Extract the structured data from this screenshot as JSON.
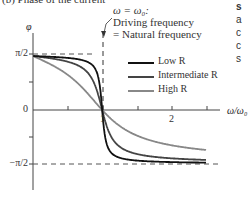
{
  "chart_data": {
    "type": "line",
    "title": "(b) Phase of the current",
    "xlabel": "ω/ω0",
    "ylabel": "φ",
    "xlim": [
      0,
      2.5
    ],
    "ylim": [
      -1.5708,
      1.5708
    ],
    "x_ticks": [
      0.5,
      1,
      1.5,
      2,
      2.5
    ],
    "x_tick_labels": [
      "",
      "1",
      "",
      "2",
      ""
    ],
    "y_tick_labels": [
      "π/2",
      "0",
      "−π/2"
    ],
    "y_tick_values": [
      1.5708,
      0,
      -1.5708
    ],
    "reference_lines": [
      {
        "type": "horizontal",
        "value": 1.5708,
        "style": "dashed"
      },
      {
        "type": "horizontal",
        "value": -1.5708,
        "style": "dashed"
      },
      {
        "type": "vertical",
        "value": 1,
        "style": "dashed"
      }
    ],
    "annotation": {
      "lines": [
        "ω = ω0:",
        "Driving frequency",
        "= Natural frequency"
      ],
      "x": 1
    },
    "legend_position": "upper right",
    "series": [
      {
        "name": "Low R",
        "color": "#111111",
        "x": [
          0.02,
          0.5,
          0.8,
          0.95,
          1.0,
          1.05,
          1.2,
          1.5,
          2.0,
          2.5
        ],
        "values": [
          1.57,
          1.48,
          1.36,
          1.04,
          0.0,
          -1.01,
          -1.33,
          -1.48,
          -1.52,
          -1.53
        ]
      },
      {
        "name": "Intermediate R",
        "color": "#444444",
        "x": [
          0.02,
          0.5,
          0.8,
          0.95,
          1.0,
          1.05,
          1.2,
          1.5,
          2.0,
          2.5
        ],
        "values": [
          1.57,
          1.4,
          1.11,
          0.52,
          0.0,
          -0.5,
          -1.06,
          -1.31,
          -1.42,
          -1.45
        ]
      },
      {
        "name": "High R",
        "color": "#888888",
        "x": [
          0.02,
          0.5,
          0.8,
          0.95,
          1.0,
          1.05,
          1.2,
          1.5,
          2.0,
          2.5
        ],
        "values": [
          1.56,
          1.12,
          0.49,
          0.12,
          0.0,
          -0.12,
          -0.42,
          -0.78,
          -1.0,
          -1.13
        ]
      }
    ]
  },
  "title": "(b) Phase of the current",
  "annotation": {
    "line1": "ω = ω₀:",
    "line2": "Driving frequency",
    "line3": "= Natural frequency"
  },
  "axes": {
    "ylabel": "φ",
    "xlabel": "ω/ω₀",
    "y_pi2": "π/2",
    "y_zero": "0",
    "y_negpi2": "−π/2",
    "x_one": "1",
    "x_two": "2"
  },
  "legend": {
    "low": "Low R",
    "intermediate": "Intermediate R",
    "high": "High R"
  },
  "side_text": {
    "l1": "s",
    "l2": "a",
    "l3": "c",
    "l4": "c",
    "l5": "s"
  }
}
